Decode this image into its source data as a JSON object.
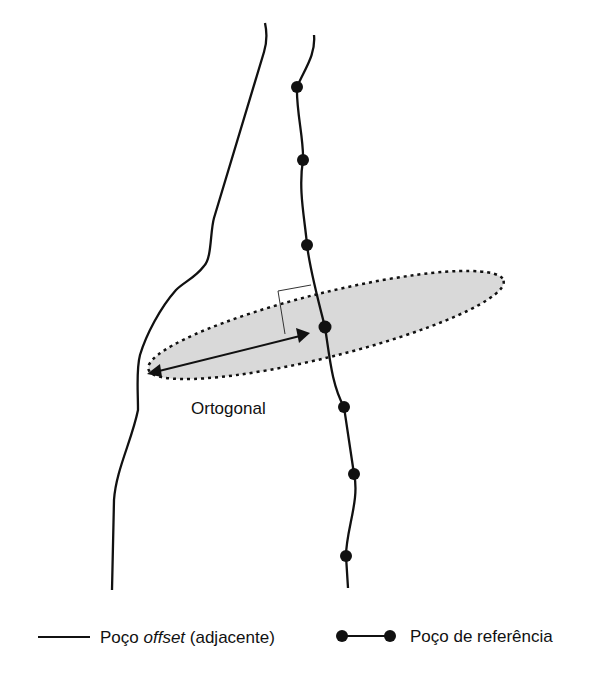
{
  "diagram": {
    "label_ortogonal": "Ortogonal",
    "colors": {
      "ink": "#111111",
      "zone_fill": "#d9d9d9"
    },
    "reference_well_points": [
      [
        297,
        87
      ],
      [
        303,
        160
      ],
      [
        307,
        245
      ],
      [
        325,
        327
      ],
      [
        344,
        407
      ],
      [
        354,
        474
      ],
      [
        346,
        556
      ]
    ]
  },
  "legend": {
    "offset_prefix": "Poço ",
    "offset_italic": "offset",
    "offset_suffix": " (adjacente)",
    "reference_label": "Poço de referência"
  }
}
